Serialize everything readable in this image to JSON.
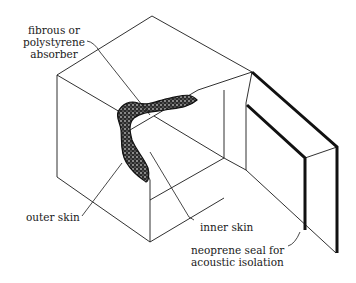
{
  "diagram": {
    "type": "isometric cut-away of acoustic enclosure",
    "labels": {
      "absorber": [
        "fibrous or",
        "polystyrene",
        "absorber"
      ],
      "outer_skin": "outer skin",
      "inner_skin": "inner skin",
      "seal": [
        "neoprene seal for",
        "acoustic isolation"
      ]
    },
    "colors": {
      "line": "#1a1a1a",
      "background": "#ffffff"
    }
  }
}
